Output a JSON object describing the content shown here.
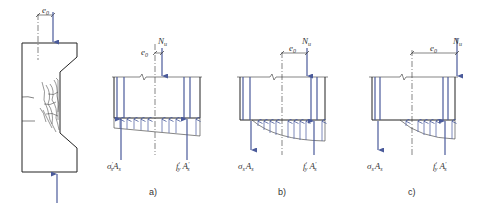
{
  "figure": {
    "column": {
      "eccentricity_label": "e",
      "eccentricity_sub": "0"
    },
    "panels": [
      {
        "id": "a",
        "caption": "a)",
        "load_label": "N",
        "load_sub": "u",
        "ecc_label": "e",
        "ecc_sub": "0",
        "left_force": {
          "main": "σ",
          "sup": "′",
          "sub": "s",
          "tail": "A",
          "tail_sub": "s"
        },
        "right_force": {
          "main": "f",
          "sup": "′",
          "sub": "y",
          "tail": "A",
          "tail_sup": "′",
          "tail_sub": "s"
        },
        "stress_shape": "trapezoid"
      },
      {
        "id": "b",
        "caption": "b)",
        "load_label": "N",
        "load_sub": "u",
        "ecc_label": "e",
        "ecc_sub": "0",
        "left_force": {
          "main": "σ",
          "sub": "s",
          "tail": "A",
          "tail_sub": "s"
        },
        "right_force": {
          "main": "f",
          "sup": "′",
          "sub": "y",
          "tail": "A",
          "tail_sup": "′",
          "tail_sub": "s"
        },
        "stress_shape": "curved-partial"
      },
      {
        "id": "c",
        "caption": "c)",
        "load_label": "N",
        "load_sub": "u",
        "ecc_label": "e",
        "ecc_sub": "0",
        "left_force": {
          "main": "σ",
          "sub": "s",
          "tail": "A",
          "tail_sub": "s"
        },
        "right_force": {
          "main": "f",
          "sup": "′",
          "sub": "y",
          "tail": "A",
          "tail_sup": "′",
          "tail_sub": "s"
        },
        "stress_shape": "curved-small"
      }
    ]
  }
}
